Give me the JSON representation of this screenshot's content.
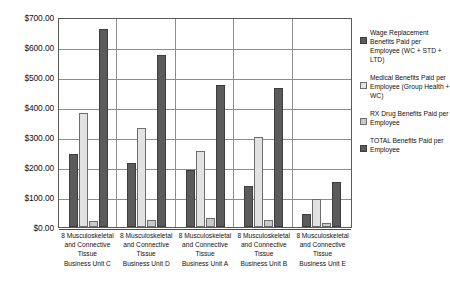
{
  "chart_data": {
    "type": "bar",
    "title": "",
    "subtitle": "",
    "xlabel": "",
    "ylabel": "",
    "ylim": [
      0,
      700
    ],
    "ytick_values": [
      0,
      100,
      200,
      300,
      400,
      500,
      600,
      700
    ],
    "ytick_labels": [
      "$0.00",
      "$100.00",
      "$200.00",
      "$300.00",
      "$400.00",
      "$500.00",
      "$600.00",
      "$700.00"
    ],
    "grid": true,
    "legend_position": "right",
    "categories": [
      "8 Musculoskeletal and Connective Tissue Business Unit C",
      "8 Musculoskeletal and Connective Tissue Business Unit D",
      "8 Musculoskeletal and Connective Tissue Business Unit A",
      "8 Musculoskeletal and Connective Tissue Business Unit B",
      "8 Musculoskeletal and Connective Tissue Business Unit E"
    ],
    "category_lines": [
      [
        "8 Musculoskeletal",
        "and Connective",
        "Tissue",
        "Business Unit C"
      ],
      [
        "8 Musculoskeletal",
        "and Connective",
        "Tissue",
        "Business Unit D"
      ],
      [
        "8 Musculoskeletal",
        "and Connective",
        "Tissue",
        "Business Unit A"
      ],
      [
        "8 Musculoskeletal",
        "and Connective",
        "Tissue",
        "Business Unit B"
      ],
      [
        "8 Musculoskeletal",
        "and Connective",
        "Tissue",
        "Business Unit E"
      ]
    ],
    "series": [
      {
        "name": "Wage Replacement Benefits Paid per Employee (WC + STD + LTD)",
        "color": "#5b5b5b",
        "values": [
          245,
          212,
          190,
          137,
          45
        ]
      },
      {
        "name": "Medical Benefits Paid per Employee (Group Health + WC)",
        "color": "#e2e2e2",
        "values": [
          380,
          330,
          252,
          300,
          92
        ]
      },
      {
        "name": "RX Drug Benefits Paid per Employee",
        "color": "#c9c9c9",
        "values": [
          20,
          25,
          30,
          25,
          12
        ]
      },
      {
        "name": "TOTAL Benefits Paid per Employee",
        "color": "#5b5b5b",
        "values": [
          660,
          573,
          472,
          462,
          150
        ]
      }
    ]
  },
  "legend": {
    "items": [
      {
        "label": "Wage Replacement Benefits Paid per Employee (WC + STD + LTD)",
        "swatch": "s0"
      },
      {
        "label": "Medical Benefits Paid per Employee (Group Health + WC)",
        "swatch": "s1"
      },
      {
        "label": "RX Drug Benefits Paid per Employee",
        "swatch": "s2"
      },
      {
        "label": "TOTAL Benefits Paid per Employee",
        "swatch": "s3"
      }
    ]
  }
}
